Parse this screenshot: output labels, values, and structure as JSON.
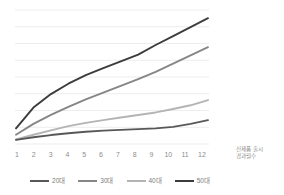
{
  "chart_data": {
    "type": "line",
    "title": "",
    "subtitle": "",
    "xlabel": "신제품 출시 경과월수",
    "ylabel": "",
    "x": [
      1,
      2,
      3,
      4,
      5,
      6,
      7,
      8,
      9,
      10,
      11,
      12
    ],
    "categories": [
      "1",
      "2",
      "3",
      "4",
      "5",
      "6",
      "7",
      "8",
      "9",
      "10",
      "11",
      "12"
    ],
    "xlim": [
      1,
      12
    ],
    "ylim": [
      0,
      9
    ],
    "grid": "horizontal",
    "gridline_count": 9,
    "y_axis_labels_visible": false,
    "legend_position": "bottom",
    "series": [
      {
        "name": "20대",
        "color": "#58585a",
        "values": [
          0.28,
          0.45,
          0.6,
          0.72,
          0.82,
          0.9,
          0.95,
          1.0,
          1.05,
          1.15,
          1.35,
          1.6
        ]
      },
      {
        "name": "30대",
        "color": "#868686",
        "values": [
          0.62,
          1.35,
          1.95,
          2.5,
          3.0,
          3.45,
          3.9,
          4.35,
          4.85,
          5.4,
          5.95,
          6.5
        ]
      },
      {
        "name": "40대",
        "color": "#b4b4b4",
        "values": [
          0.3,
          0.62,
          0.92,
          1.2,
          1.42,
          1.6,
          1.78,
          1.95,
          2.12,
          2.35,
          2.6,
          2.95
        ]
      },
      {
        "name": "50대",
        "color": "#3c3c3e",
        "values": [
          1.05,
          2.45,
          3.35,
          4.05,
          4.62,
          5.1,
          5.55,
          6.0,
          6.65,
          7.25,
          7.85,
          8.45
        ]
      }
    ]
  },
  "axis_title": {
    "line1": "신제품 출시",
    "line2": "경과월수"
  },
  "colors": {
    "gridline": "#ededed",
    "tick_text": "#8d8d8d",
    "legend_text": "#7d7d7d",
    "background": "#ffffff"
  }
}
